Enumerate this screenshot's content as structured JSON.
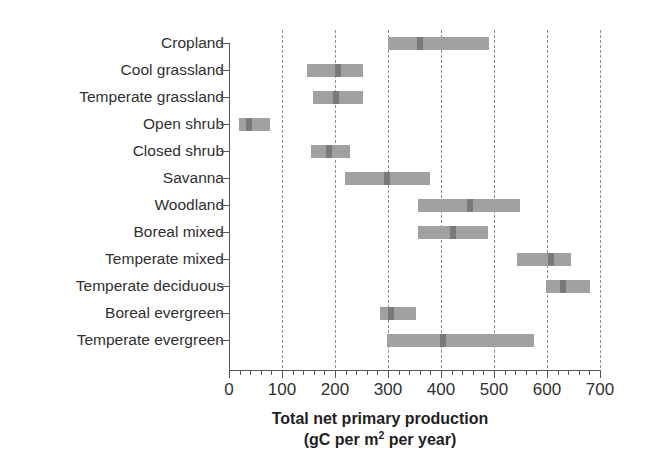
{
  "chart_data": {
    "type": "bar",
    "subtype": "range-bar-with-median",
    "title": "",
    "xlabel_line1": "Total net primary production",
    "xlabel_line2_pre": "(gC per m",
    "xlabel_line2_sup": "2",
    "xlabel_line2_post": " per year)",
    "ylabel": "",
    "xlim": [
      0,
      700
    ],
    "xticks": [
      0,
      100,
      200,
      300,
      400,
      500,
      600,
      700
    ],
    "xtick_labels": [
      "0",
      "100",
      "200",
      "300",
      "400",
      "500",
      "600",
      "700"
    ],
    "minor_tick_interval": 20,
    "grid": "vertical dashed gridlines at every major tick except 0",
    "legend": "none",
    "bar_color": "#a0a0a0",
    "median_color": "#7a7a7a",
    "axis_color": "#555555",
    "gridline_color": "#8d8d8d",
    "categories": [
      "Cropland",
      "Cool grassland",
      "Temperate grassland",
      "Open shrub",
      "Closed shrub",
      "Savanna",
      "Woodland",
      "Boreal mixed",
      "Temperate mixed",
      "Temperate deciduous",
      "Boreal evergreen",
      "Temperate evergreen"
    ],
    "series": [
      {
        "name": "Total net primary production range",
        "points": [
          {
            "category": "Cropland",
            "low": 300,
            "high": 490,
            "median": 361
          },
          {
            "category": "Cool grassland",
            "low": 148,
            "high": 253,
            "median": 206
          },
          {
            "category": "Temperate grassland",
            "low": 159,
            "high": 253,
            "median": 202
          },
          {
            "category": "Open shrub",
            "low": 19,
            "high": 78,
            "median": 38
          },
          {
            "category": "Closed shrub",
            "low": 155,
            "high": 229,
            "median": 188
          },
          {
            "category": "Savanna",
            "low": 219,
            "high": 380,
            "median": 299
          },
          {
            "category": "Woodland",
            "low": 357,
            "high": 550,
            "median": 455
          },
          {
            "category": "Boreal mixed",
            "low": 357,
            "high": 489,
            "median": 423
          },
          {
            "category": "Temperate mixed",
            "low": 544,
            "high": 646,
            "median": 608
          },
          {
            "category": "Temperate deciduous",
            "low": 599,
            "high": 682,
            "median": 631
          },
          {
            "category": "Boreal evergreen",
            "low": 285,
            "high": 353,
            "median": 306
          },
          {
            "category": "Temperate evergreen",
            "low": 299,
            "high": 576,
            "median": 403
          }
        ]
      }
    ]
  }
}
